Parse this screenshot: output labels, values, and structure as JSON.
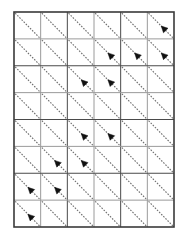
{
  "figure": {
    "title": "",
    "type": "grid-diagram"
  },
  "chart_data": {
    "type": "heatmap",
    "title": "",
    "subtitle": "",
    "xlabel": "",
    "ylabel": "",
    "grid": true,
    "legend": null,
    "columns": 6,
    "rows": 8,
    "x": [
      1,
      2,
      3,
      4,
      5,
      6
    ],
    "y": [
      1,
      2,
      3,
      4,
      5,
      6,
      7,
      8
    ],
    "categories": [
      "col 1",
      "col 2",
      "col 3",
      "col 4",
      "col 5",
      "col 6"
    ],
    "tick_labels_x": [],
    "tick_labels_y": [],
    "cell_diagonal_direction": "top-left-to-bottom-right",
    "cell_diagonal_style": "dashed",
    "arrow_direction": "up-left",
    "arrow_position_along_diagonal": 0.58,
    "series": [
      {
        "name": "row 1",
        "values": [
          0,
          0,
          0,
          0,
          0,
          1
        ]
      },
      {
        "name": "row 2",
        "values": [
          0,
          0,
          0,
          1,
          1,
          1
        ]
      },
      {
        "name": "row 3",
        "values": [
          0,
          0,
          1,
          1,
          0,
          0
        ]
      },
      {
        "name": "row 4",
        "values": [
          0,
          0,
          0,
          0,
          0,
          0
        ]
      },
      {
        "name": "row 5",
        "values": [
          0,
          0,
          1,
          1,
          0,
          0
        ]
      },
      {
        "name": "row 6",
        "values": [
          0,
          1,
          1,
          0,
          0,
          0
        ]
      },
      {
        "name": "row 7",
        "values": [
          1,
          1,
          0,
          0,
          0,
          0
        ]
      },
      {
        "name": "row 8",
        "values": [
          1,
          0,
          0,
          0,
          0,
          0
        ]
      }
    ],
    "arrow_cells": [
      {
        "row": 1,
        "col": 6
      },
      {
        "row": 2,
        "col": 4
      },
      {
        "row": 2,
        "col": 5
      },
      {
        "row": 2,
        "col": 6
      },
      {
        "row": 3,
        "col": 3
      },
      {
        "row": 3,
        "col": 4
      },
      {
        "row": 5,
        "col": 3
      },
      {
        "row": 5,
        "col": 4
      },
      {
        "row": 6,
        "col": 2
      },
      {
        "row": 6,
        "col": 3
      },
      {
        "row": 7,
        "col": 1
      },
      {
        "row": 7,
        "col": 2
      },
      {
        "row": 8,
        "col": 1
      }
    ]
  },
  "geometry": {
    "left": 14,
    "top": 12,
    "right": 174,
    "bottom": 227,
    "cell_width": 26.67,
    "cell_height": 26.88
  },
  "colors": {
    "background": "#ffffff",
    "grid_line": "#4a4a4a",
    "grid_line_light": "#9a9a9a",
    "outer_border": "#3a3a3a",
    "diagonal": "#6e6e6e",
    "arrow": "#111111"
  }
}
